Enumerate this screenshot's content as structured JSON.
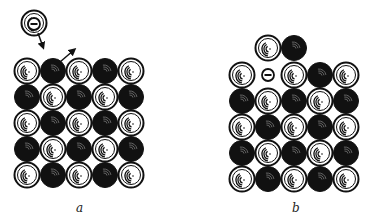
{
  "panels": [
    {
      "id": "a",
      "label": "a",
      "label_pos": [
        76,
        212
      ],
      "origin": [
        27,
        71
      ],
      "spacing": 26,
      "grid": [
        [
          "W",
          "B",
          "W",
          "B",
          "W"
        ],
        [
          "B",
          "W",
          "B",
          "W",
          "B"
        ],
        [
          "W",
          "B",
          "W",
          "B",
          "W"
        ],
        [
          "B",
          "W",
          "B",
          "W",
          "B"
        ],
        [
          "W",
          "B",
          "W",
          "B",
          "W"
        ]
      ],
      "extra_atoms": [
        {
          "type": "W",
          "x": 34,
          "y": 23,
          "note": "incoming ion with electron"
        }
      ],
      "electrons": [
        {
          "x": 34,
          "y": 24
        }
      ],
      "arrows": [
        {
          "from": [
            38,
            33
          ],
          "to": [
            43,
            47
          ],
          "name": "incoming-arrow"
        },
        {
          "from": [
            60,
            62
          ],
          "to": [
            74,
            50
          ],
          "name": "ejected-arrow"
        }
      ]
    },
    {
      "id": "b",
      "label": "b",
      "label_pos": [
        292,
        212
      ],
      "origin": [
        242,
        75
      ],
      "spacing": 26,
      "grid": [
        [
          "W",
          "E",
          "W",
          "B",
          "W"
        ],
        [
          "B",
          "W",
          "B",
          "W",
          "B"
        ],
        [
          "W",
          "B",
          "W",
          "B",
          "W"
        ],
        [
          "B",
          "W",
          "B",
          "W",
          "B"
        ],
        [
          "W",
          "B",
          "W",
          "B",
          "W"
        ]
      ],
      "extra_atoms": [
        {
          "type": "W",
          "x": 268,
          "y": 48
        },
        {
          "type": "B",
          "x": 294,
          "y": 48
        }
      ],
      "electrons": [
        {
          "x": 268,
          "y": 75
        }
      ],
      "arrows": []
    }
  ],
  "colors": {
    "ink": "#111111",
    "paper": "#ffffff"
  },
  "legend": {
    "W": "white-atom",
    "B": "black-atom",
    "E": "vacancy-with-electron"
  }
}
